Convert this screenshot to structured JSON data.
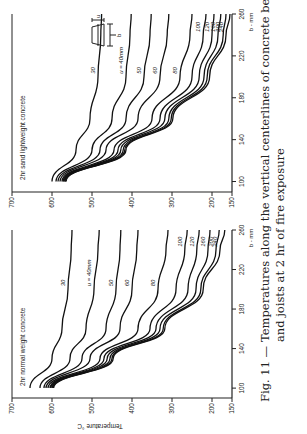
{
  "caption": {
    "figure_label": "Fig. 11 —",
    "line1": "Temperatures along the vertical centerlines of concrete beams",
    "line2": "and joists at 2 hr of fire exposure"
  },
  "chart_data": [
    {
      "type": "line",
      "title": "2hr normal weight concrete",
      "xlabel": "b - mm",
      "ylabel": "Temperature °C",
      "xlim": [
        90,
        260
      ],
      "ylim": [
        150,
        700
      ],
      "xticks": [
        100,
        140,
        180,
        220,
        260
      ],
      "yticks": [
        700,
        600,
        500,
        400,
        300,
        200,
        150
      ],
      "series": [
        {
          "name": "30",
          "label": "30",
          "x": [
            100,
            130,
            160,
            200,
            240,
            260
          ],
          "y": [
            655,
            600,
            575,
            560,
            552,
            550
          ]
        },
        {
          "name": "40",
          "label": "u = 40mm",
          "x": [
            100,
            130,
            160,
            200,
            240,
            260
          ],
          "y": [
            630,
            555,
            515,
            495,
            485,
            482
          ]
        },
        {
          "name": "50",
          "label": "50",
          "x": [
            100,
            130,
            160,
            200,
            240,
            260
          ],
          "y": [
            620,
            525,
            465,
            440,
            430,
            428
          ]
        },
        {
          "name": "60",
          "label": "60",
          "x": [
            100,
            130,
            160,
            200,
            240,
            260
          ],
          "y": [
            615,
            505,
            430,
            400,
            388,
            385
          ]
        },
        {
          "name": "80",
          "label": "80",
          "x": [
            100,
            130,
            160,
            200,
            240,
            260
          ],
          "y": [
            610,
            480,
            385,
            335,
            315,
            310
          ]
        },
        {
          "name": "100",
          "label": "100",
          "x": [
            100,
            130,
            160,
            200,
            240,
            260
          ],
          "y": [
            605,
            470,
            355,
            290,
            268,
            262
          ]
        },
        {
          "name": "120",
          "label": "120",
          "x": [
            100,
            130,
            160,
            200,
            240,
            260
          ],
          "y": [
            603,
            462,
            340,
            260,
            238,
            232
          ]
        },
        {
          "name": "160",
          "label": "160",
          "x": [
            100,
            130,
            160,
            200,
            240,
            260
          ],
          "y": [
            600,
            455,
            330,
            240,
            210,
            205
          ]
        },
        {
          "name": "200",
          "label": "200",
          "x": [
            100,
            130,
            160,
            200,
            240,
            260
          ],
          "y": [
            598,
            450,
            322,
            228,
            190,
            182
          ]
        },
        {
          "name": "240",
          "label": "240",
          "x": [
            100,
            130,
            160,
            200,
            240,
            260
          ],
          "y": [
            596,
            447,
            318,
            222,
            180,
            168
          ]
        }
      ]
    },
    {
      "type": "line",
      "title": "2hr sand lightweight concrete",
      "xlabel": "b - mm",
      "ylabel": "Temperature °C",
      "xlim": [
        90,
        260
      ],
      "ylim": [
        150,
        700
      ],
      "xticks": [
        100,
        140,
        180,
        220,
        260
      ],
      "yticks": [
        700,
        600,
        500,
        400,
        300,
        200,
        150
      ],
      "series": [
        {
          "name": "30",
          "label": "30",
          "x": [
            100,
            130,
            160,
            200,
            240,
            260
          ],
          "y": [
            600,
            540,
            505,
            485,
            478,
            476
          ]
        },
        {
          "name": "40",
          "label": "u = 40mm",
          "x": [
            100,
            130,
            160,
            200,
            240,
            260
          ],
          "y": [
            590,
            500,
            450,
            415,
            405,
            402
          ]
        },
        {
          "name": "50",
          "label": "50",
          "x": [
            100,
            130,
            160,
            200,
            240,
            260
          ],
          "y": [
            585,
            480,
            415,
            370,
            355,
            352
          ]
        },
        {
          "name": "60",
          "label": "60",
          "x": [
            100,
            130,
            160,
            200,
            240,
            260
          ],
          "y": [
            580,
            465,
            385,
            330,
            312,
            308
          ]
        },
        {
          "name": "80",
          "label": "80",
          "x": [
            100,
            130,
            160,
            200,
            240,
            260
          ],
          "y": [
            575,
            445,
            350,
            280,
            255,
            250
          ]
        },
        {
          "name": "100",
          "label": "100",
          "x": [
            100,
            130,
            160,
            200,
            240,
            260
          ],
          "y": [
            572,
            435,
            330,
            250,
            222,
            215
          ]
        },
        {
          "name": "120",
          "label": "120",
          "x": [
            100,
            130,
            160,
            200,
            240,
            260
          ],
          "y": [
            570,
            428,
            318,
            232,
            200,
            195
          ]
        },
        {
          "name": "160",
          "label": "160",
          "x": [
            100,
            130,
            160,
            200,
            240,
            260
          ],
          "y": [
            568,
            422,
            308,
            220,
            185,
            178
          ]
        },
        {
          "name": "200",
          "label": "200",
          "x": [
            100,
            130,
            160,
            200,
            240,
            260
          ],
          "y": [
            566,
            418,
            302,
            212,
            172,
            165
          ]
        },
        {
          "name": "240",
          "label": "240",
          "x": [
            100,
            130,
            160,
            200,
            240,
            260
          ],
          "y": [
            565,
            415,
            298,
            206,
            165,
            155
          ]
        }
      ]
    }
  ],
  "inset": {
    "b_label": "b",
    "u_label": "u"
  }
}
